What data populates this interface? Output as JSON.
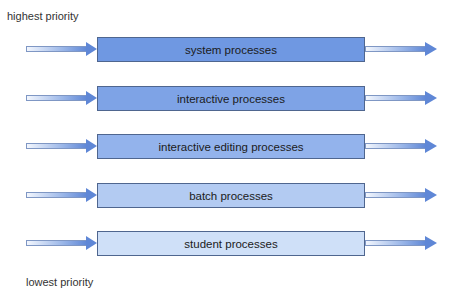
{
  "labels": {
    "top": "highest priority",
    "bottom": "lowest priority"
  },
  "queues": [
    {
      "label": "system processes",
      "color": "#6f98e2"
    },
    {
      "label": "interactive processes",
      "color": "#7ea3e6"
    },
    {
      "label": "interactive editing processes",
      "color": "#93b3ec"
    },
    {
      "label": "batch processes",
      "color": "#b3cbf2"
    },
    {
      "label": "student processes",
      "color": "#cfe0f8"
    }
  ]
}
